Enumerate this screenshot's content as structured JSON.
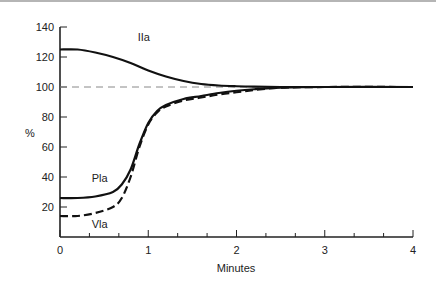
{
  "chart_data": {
    "type": "line",
    "title": "",
    "xlabel": "Minutes",
    "ylabel": "%",
    "xlim": [
      0,
      4
    ],
    "ylim": [
      0,
      140
    ],
    "xticks": [
      "0",
      "1",
      "2",
      "3",
      "4"
    ],
    "yticks": [
      "20",
      "40",
      "60",
      "80",
      "100",
      "120",
      "140"
    ],
    "grid": false,
    "legend": "inline labels",
    "reference_line": {
      "y": 100,
      "style": "dashed",
      "color": "#888888"
    },
    "series": [
      {
        "name": "IIa",
        "style": "solid",
        "x": [
          0,
          0.2,
          0.4,
          0.6,
          0.8,
          1.0,
          1.2,
          1.4,
          1.6,
          1.8,
          2.0,
          2.2,
          2.5,
          3.0,
          3.5,
          4.0
        ],
        "values": [
          125,
          125,
          123,
          120,
          116,
          111,
          107,
          104,
          102,
          101,
          100.5,
          100.2,
          100,
          100,
          100,
          100
        ]
      },
      {
        "name": "Pla",
        "style": "solid",
        "x": [
          0,
          0.2,
          0.4,
          0.6,
          0.7,
          0.8,
          0.9,
          1.0,
          1.1,
          1.2,
          1.4,
          1.6,
          1.8,
          2.0,
          2.2,
          2.5,
          3.0,
          4.0
        ],
        "values": [
          26,
          26,
          27,
          30,
          35,
          45,
          62,
          76,
          84,
          88,
          92,
          94,
          96,
          97.5,
          98.5,
          99.5,
          100,
          100
        ]
      },
      {
        "name": "Vla",
        "style": "dashed",
        "x": [
          0,
          0.2,
          0.4,
          0.6,
          0.7,
          0.8,
          0.9,
          1.0,
          1.1,
          1.2,
          1.4,
          1.6,
          1.8,
          2.0,
          2.2,
          2.5,
          3.0,
          4.0
        ],
        "values": [
          14,
          14,
          16,
          20,
          26,
          40,
          60,
          75,
          83,
          87,
          91,
          93,
          95,
          96.5,
          98,
          99.5,
          100,
          100
        ]
      }
    ],
    "annotations": [
      {
        "text": "IIa",
        "x": 0.95,
        "y": 131
      },
      {
        "text": "Pla",
        "x": 0.45,
        "y": 37
      },
      {
        "text": "Vla",
        "x": 0.45,
        "y": 6
      }
    ]
  }
}
